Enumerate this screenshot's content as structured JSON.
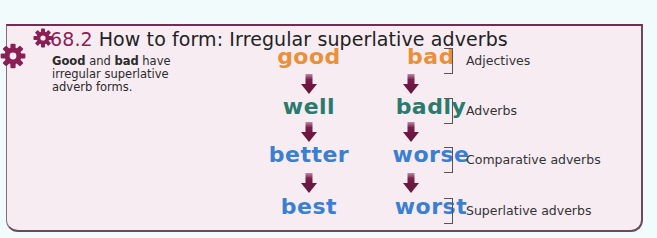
{
  "section": {
    "number": "68.2",
    "title": "How to form: Irregular superlative adverbs"
  },
  "intro": {
    "word1": "Good",
    "mid1": " and ",
    "word2": "bad",
    "rest": " have irregular superlative adverb forms."
  },
  "columns": [
    {
      "words": [
        {
          "text": "good",
          "color": "#e8913a"
        },
        {
          "text": "well",
          "color": "#2a7a6e"
        },
        {
          "text": "better",
          "color": "#3a7fd0"
        },
        {
          "text": "best",
          "color": "#3a7fd0"
        }
      ]
    },
    {
      "words": [
        {
          "text": "bad",
          "color": "#e8913a"
        },
        {
          "text": "badly",
          "color": "#2a7a6e"
        },
        {
          "text": "worse",
          "color": "#3a7fd0"
        },
        {
          "text": "worst",
          "color": "#3a7fd0"
        }
      ]
    }
  ],
  "labels": [
    "Adjectives",
    "Adverbs",
    "Comparative adverbs",
    "Superlative adverbs"
  ],
  "colors": {
    "accent": "#8a1f55",
    "arrow": "#7a1f4c",
    "panel_bg": "#f8ecf3",
    "page_bg": "#f1fbfb"
  },
  "icons": [
    "gear-icon-small",
    "gear-icon-large",
    "arrow-down-icon"
  ]
}
